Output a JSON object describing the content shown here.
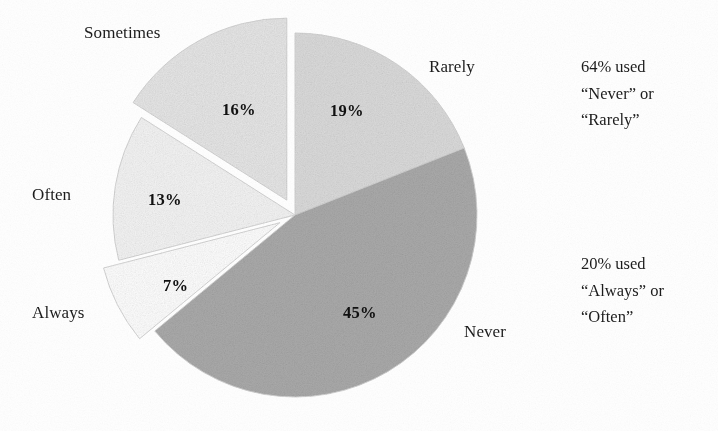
{
  "chart_data": {
    "type": "pie",
    "title": "",
    "subtitle": "",
    "xlabel": "",
    "ylabel": "",
    "grid": false,
    "legend_position": "none",
    "labels_outside": true,
    "start_angle_deg": 0,
    "direction": "clockwise",
    "categories": [
      "Rarely",
      "Never",
      "Always",
      "Often",
      "Sometimes"
    ],
    "values": [
      19,
      45,
      7,
      13,
      16
    ],
    "value_labels": [
      "19%",
      "45%",
      "7%",
      "13%",
      "16%"
    ],
    "units": "percent",
    "total": 100,
    "slices": [
      {
        "label": "Rarely",
        "value": 19,
        "value_label": "19%",
        "color": "#dcdcdc",
        "exploded": false,
        "start_deg": 0,
        "end_deg": 68.4
      },
      {
        "label": "Never",
        "value": 45,
        "value_label": "45%",
        "color": "#ababab",
        "exploded": false,
        "start_deg": 68.4,
        "end_deg": 230.4
      },
      {
        "label": "Always",
        "value": 7,
        "value_label": "7%",
        "color": "#ffffff",
        "exploded": true,
        "start_deg": 230.4,
        "end_deg": 255.6
      },
      {
        "label": "Often",
        "value": 13,
        "value_label": "13%",
        "color": "#f5f5f5",
        "exploded": false,
        "start_deg": 255.6,
        "end_deg": 302.4
      },
      {
        "label": "Sometimes",
        "value": 16,
        "value_label": "16%",
        "color": "#e7e7e7",
        "exploded": true,
        "start_deg": 302.4,
        "end_deg": 360
      }
    ],
    "annotations": [
      {
        "id": "top",
        "lines": [
          "64% used",
          "“Never” or",
          "“Rarely”"
        ],
        "text": "64% used “Never” or “Rarely”",
        "value": 64,
        "refers_to": [
          "Never",
          "Rarely"
        ]
      },
      {
        "id": "bottom",
        "lines": [
          "20% used",
          "“Always” or",
          "“Often”"
        ],
        "text": "20% used “Always” or “Often”",
        "value": 20,
        "refers_to": [
          "Always",
          "Often"
        ]
      }
    ]
  },
  "chart_labels": {
    "sometimes": "Sometimes",
    "rarely": "Rarely",
    "often": "Often",
    "always": "Always",
    "never": "Never"
  },
  "chart_values": {
    "sometimes": "16%",
    "rarely": "19%",
    "often": "13%",
    "always": "7%",
    "never": "45%"
  },
  "annotations": {
    "top": {
      "line1": "64% used",
      "line2": "“Never” or",
      "line3": "“Rarely”"
    },
    "bottom": {
      "line1": "20% used",
      "line2": "“Always” or",
      "line3": "“Often”"
    }
  },
  "colors": {
    "background": "#ffffff",
    "text": "#1c1c1c",
    "never": "#ababab",
    "rarely": "#dcdcdc",
    "sometimes": "#e7e7e7",
    "often": "#f5f5f5",
    "always": "#ffffff",
    "slice_edge": "#d2d2d2"
  }
}
